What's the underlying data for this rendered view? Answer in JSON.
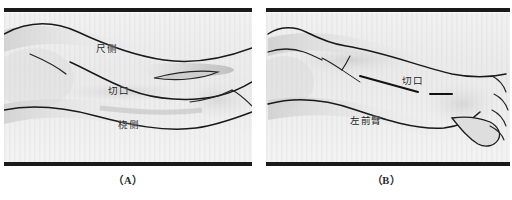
{
  "figure": {
    "background_color": "#ffffff",
    "plate_color": "#eeeeee",
    "ink_color": "#1a1a1a"
  },
  "panels": [
    {
      "id": "A",
      "caption": "（A）",
      "labels": [
        {
          "name": "ulnar-side",
          "text": "尺侧",
          "x": 96,
          "y": 40
        },
        {
          "name": "incision",
          "text": "切口",
          "x": 108,
          "y": 82
        },
        {
          "name": "radial-side",
          "text": "桡侧",
          "x": 118,
          "y": 116
        }
      ]
    },
    {
      "id": "B",
      "caption": "（B）",
      "labels": [
        {
          "name": "incision",
          "text": "切口",
          "x": 140,
          "y": 72
        },
        {
          "name": "left-forearm",
          "text": "左前臂",
          "x": 90,
          "y": 112
        }
      ]
    }
  ]
}
